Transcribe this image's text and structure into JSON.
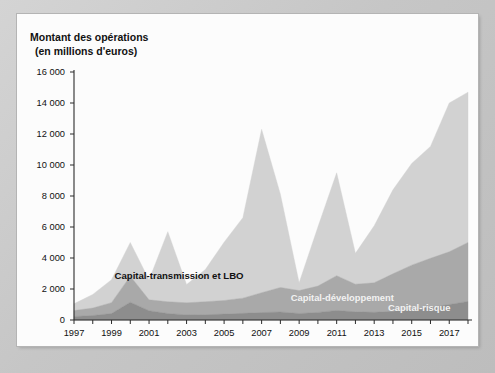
{
  "chart_data": {
    "type": "area",
    "stacked": true,
    "title": "Montant des opérations",
    "subtitle": "(en millions d'euros)",
    "xlabel": "",
    "ylabel": "Montant des opérations (en millions d'euros)",
    "ylim": [
      0,
      16000
    ],
    "ytick_step": 2000,
    "ytick_labels": [
      "0",
      "2 000",
      "4 000",
      "6 000",
      "8 000",
      "10 000",
      "12 000",
      "14 000",
      "16 000"
    ],
    "ytick_values": [
      0,
      2000,
      4000,
      6000,
      8000,
      10000,
      12000,
      14000,
      16000
    ],
    "grid": false,
    "legend_position": "inline-annotations",
    "x": [
      1997,
      1998,
      1999,
      2000,
      2001,
      2002,
      2003,
      2004,
      2005,
      2006,
      2007,
      2008,
      2009,
      2010,
      2011,
      2012,
      2013,
      2014,
      2015,
      2016,
      2017,
      2018
    ],
    "xtick_labels": [
      "1997",
      "1999",
      "2001",
      "2003",
      "2005",
      "2007",
      "2009",
      "2011",
      "2013",
      "2015",
      "2017"
    ],
    "xtick_values": [
      1997,
      1999,
      2001,
      2003,
      2005,
      2007,
      2009,
      2011,
      2013,
      2015,
      2017
    ],
    "series": [
      {
        "name": "Capital-risque",
        "color": "#8d8d8d",
        "order": 1,
        "values": [
          230,
          290,
          420,
          1150,
          600,
          420,
          330,
          340,
          380,
          430,
          480,
          520,
          420,
          490,
          620,
          530,
          500,
          560,
          680,
          820,
          1000,
          1200
        ]
      },
      {
        "name": "Capital-développement",
        "color": "#a9a9a9",
        "order": 2,
        "values": [
          380,
          480,
          700,
          1680,
          700,
          760,
          780,
          840,
          880,
          980,
          1280,
          1580,
          1480,
          1700,
          2240,
          1780,
          1900,
          2420,
          2860,
          3160,
          3400,
          3800
        ]
      },
      {
        "name": "Capital-transmission et LBO",
        "color": "#d2d2d2",
        "order": 3,
        "values": [
          440,
          880,
          1480,
          2170,
          1280,
          4520,
          1180,
          2080,
          3760,
          5190,
          10540,
          6020,
          500,
          3810,
          6640,
          1990,
          3680,
          5420,
          6560,
          7220,
          9600,
          9700
        ]
      }
    ],
    "totals": [
      1050,
      1650,
      2600,
      5000,
      2580,
      5700,
      2290,
      3260,
      5020,
      6600,
      12300,
      8120,
      2400,
      6000,
      9500,
      4300,
      6080,
      8400,
      10100,
      11200,
      14000,
      14700
    ],
    "annotations": [
      {
        "text": "Capital-transmission et LBO",
        "x": 2002.6,
        "y": 2650,
        "style": "dark"
      },
      {
        "text": "Capital-développement",
        "x": 2011.3,
        "y": 1230,
        "style": "light"
      },
      {
        "text": "Capital-risque",
        "x": 2015.4,
        "y": 560,
        "style": "light"
      }
    ]
  },
  "colors": {
    "frame": "#c9c9c9",
    "panel": "#fcfcfc",
    "axis": "#2b2b2b",
    "capital_risque": "#8d8d8d",
    "capital_developpement": "#a9a9a9",
    "capital_transmission": "#d2d2d2"
  }
}
